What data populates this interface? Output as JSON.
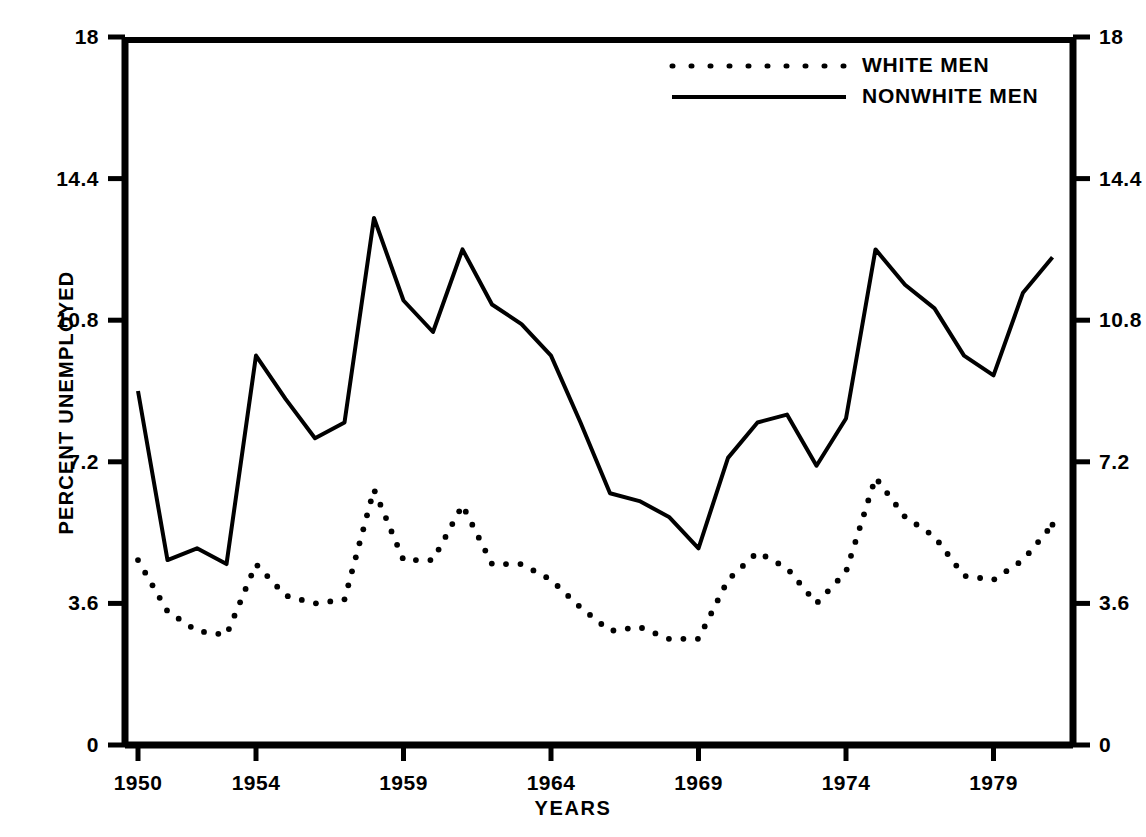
{
  "chart_data": {
    "type": "line",
    "title": "",
    "xlabel": "YEARS",
    "ylabel": "PERCENT UNEMPLOYED",
    "xlim": [
      1950,
      1981
    ],
    "ylim": [
      0,
      18
    ],
    "grid": false,
    "legend_position": "top-center-right",
    "y_ticks": [
      "0",
      "3.6",
      "7.2",
      "10.8",
      "14.4",
      "18"
    ],
    "y_tick_values": [
      0,
      3.6,
      7.2,
      10.8,
      14.4,
      18
    ],
    "x_ticks": [
      "1950",
      "1954",
      "1959",
      "1964",
      "1969",
      "1974",
      "1979"
    ],
    "x_tick_values": [
      1950,
      1954,
      1959,
      1964,
      1969,
      1974,
      1979
    ],
    "x": [
      1950,
      1951,
      1952,
      1953,
      1954,
      1955,
      1956,
      1957,
      1958,
      1959,
      1960,
      1961,
      1962,
      1963,
      1964,
      1965,
      1966,
      1967,
      1968,
      1969,
      1970,
      1971,
      1972,
      1973,
      1974,
      1975,
      1976,
      1977,
      1978,
      1979,
      1980,
      1981
    ],
    "series": [
      {
        "name": "WHITE MEN",
        "style": "dotted",
        "color": "#000000",
        "values": [
          4.7,
          3.4,
          2.9,
          2.8,
          4.6,
          3.8,
          3.6,
          3.7,
          6.5,
          4.7,
          4.7,
          6.1,
          4.6,
          4.6,
          4.2,
          3.5,
          2.9,
          3.0,
          2.7,
          2.7,
          4.2,
          4.9,
          4.5,
          3.6,
          4.4,
          6.8,
          5.8,
          5.3,
          4.3,
          4.2,
          4.7,
          5.6
        ]
      },
      {
        "name": "NONWHITE MEN",
        "style": "solid",
        "color": "#000000",
        "values": [
          9.0,
          4.7,
          5.0,
          4.6,
          9.9,
          8.8,
          7.8,
          8.2,
          13.4,
          11.3,
          10.5,
          12.6,
          11.2,
          10.7,
          9.9,
          8.2,
          6.4,
          6.2,
          5.8,
          5.0,
          7.3,
          8.2,
          8.4,
          7.1,
          8.3,
          12.6,
          11.7,
          11.1,
          9.9,
          9.4,
          11.5,
          12.4
        ]
      }
    ],
    "axis_geometry": {
      "left": 125,
      "right": 1073,
      "top": 37,
      "bottom": 745,
      "year_start": 1950,
      "px_per_year": 29.5
    }
  },
  "legend": {
    "entries": [
      {
        "label": "WHITE MEN",
        "style": "dotted"
      },
      {
        "label": "NONWHITE MEN",
        "style": "solid"
      }
    ]
  }
}
